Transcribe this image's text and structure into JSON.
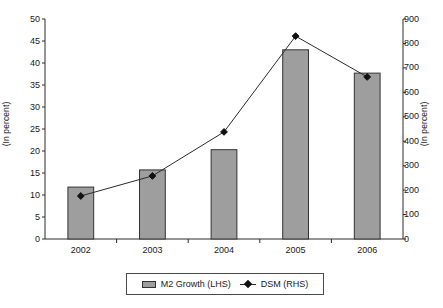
{
  "chart_data": {
    "type": "bar",
    "title": "",
    "subtitle": "",
    "categories": [
      "2002",
      "2003",
      "2004",
      "2005",
      "2006"
    ],
    "xlabel": "",
    "ylabel": "(In percent)",
    "y2label": "(In percent)",
    "ylim": [
      0,
      50
    ],
    "y2lim": [
      0,
      900
    ],
    "yticks": [
      0,
      5,
      10,
      15,
      20,
      25,
      30,
      35,
      40,
      45,
      50
    ],
    "y2ticks": [
      0,
      100,
      200,
      300,
      400,
      500,
      600,
      700,
      800,
      900
    ],
    "grid": false,
    "legend_position": "bottom",
    "series": [
      {
        "name": "M2 Growth (LHS)",
        "type": "bar",
        "axis": "left",
        "color": "#9e9e9e",
        "edge_color": "#333333",
        "values": [
          11.8,
          15.7,
          20.3,
          43.0,
          37.7
        ]
      },
      {
        "name": "DSM (RHS)",
        "type": "line",
        "axis": "right",
        "color": "#2b2b2b",
        "marker": "diamond",
        "values": [
          176,
          258,
          438,
          830,
          663
        ]
      }
    ]
  },
  "axis_titles": {
    "left": "(In percent)",
    "right": "(In percent)"
  },
  "legend": {
    "items": [
      {
        "label": "M2 Growth (LHS)",
        "marker": "bar-swatch-icon"
      },
      {
        "label": "DSM (RHS)",
        "marker": "line-diamond-icon"
      }
    ]
  },
  "tick_labels": {
    "left": [
      "50",
      "45",
      "40",
      "35",
      "30",
      "25",
      "20",
      "15",
      "10",
      "5",
      "0"
    ],
    "right": [
      "900",
      "800",
      "700",
      "600",
      "500",
      "400",
      "300",
      "200",
      "100",
      "0"
    ],
    "x": [
      "2002",
      "2003",
      "2004",
      "2005",
      "2006"
    ]
  }
}
